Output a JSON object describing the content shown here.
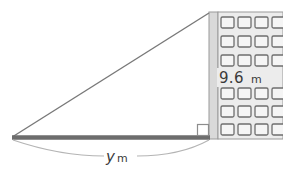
{
  "figure": {
    "type": "right-triangle-building-elevation",
    "height_label": {
      "value": "9.6",
      "unit": "m",
      "full": "9.6 m"
    },
    "base_label": {
      "value": "y",
      "unit": "m",
      "full": "y m"
    }
  },
  "building": {
    "window_rows": 6,
    "window_columns": 4,
    "wall_fill": "#ebebeb",
    "wall_edge_fill": "#d8d8d8",
    "window_fill": "#f4f4f4",
    "window_stroke": "#6e6e6e"
  },
  "geometry": {
    "ground_color": "#6d6d6d",
    "hypotenuse_color": "#757575",
    "right_angle_marker_color": "#8a8a8a",
    "brace_color": "#b0b0b0",
    "apex_x": 209,
    "apex_y": 14,
    "left_vertex_x": 13,
    "left_vertex_y": 137,
    "right_vertex_x": 209,
    "right_vertex_y": 137
  }
}
